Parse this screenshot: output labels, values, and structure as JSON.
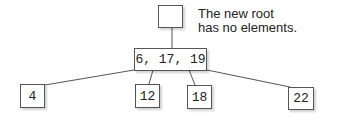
{
  "diagram": {
    "type": "tree",
    "annotation": {
      "line1": "The new root",
      "line2": "has no elements."
    },
    "nodes": {
      "root": {
        "label": ""
      },
      "middle": {
        "label": "6, 17, 19"
      },
      "leaf_1": {
        "label": "4"
      },
      "leaf_2": {
        "label": "12"
      },
      "leaf_3": {
        "label": "18"
      },
      "leaf_4": {
        "label": "22"
      }
    },
    "edges": [
      {
        "from": "root",
        "to": "middle"
      },
      {
        "from": "middle",
        "to": "leaf_1"
      },
      {
        "from": "middle",
        "to": "leaf_2"
      },
      {
        "from": "middle",
        "to": "leaf_3"
      },
      {
        "from": "middle",
        "to": "leaf_4"
      }
    ]
  }
}
